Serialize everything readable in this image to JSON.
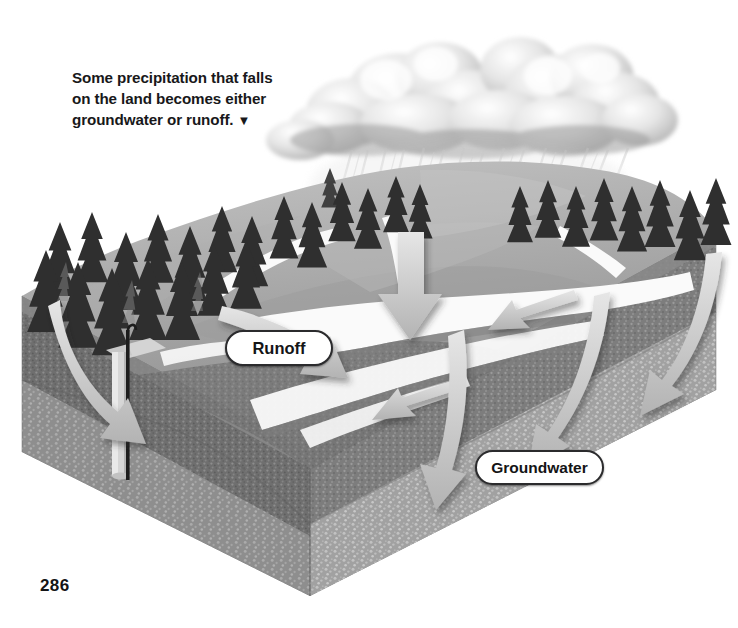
{
  "page": {
    "folio": "286",
    "background_color": "#ffffff"
  },
  "caption": {
    "line1": "Some precipitation that falls",
    "line2": "on the land becomes either",
    "line3": "groundwater or runoff.",
    "pointer_glyph": "▼",
    "color": "#18181a"
  },
  "labels": {
    "runoff": "Runoff",
    "groundwater": "Groundwater"
  },
  "diagram": {
    "style": "grayscale airbrush illustration, 3D cutaway block",
    "palette": {
      "sky": "#ffffff",
      "cloud_light": "#f2f2f2",
      "cloud_mid": "#c9c9c9",
      "cloud_shadow": "#8f8f8f",
      "rain": "#d8d8d8",
      "terrain_light": "#bdbdbd",
      "terrain_mid": "#9a9a9a",
      "terrain_dark": "#7b7b7b",
      "water_white": "#fbfbfb",
      "soil_dark": "#6f6f6f",
      "soil_speckle": "#8c8c8c",
      "aquifer": "#a3a3a3",
      "arrow_fill": "#cfcfcf",
      "arrow_edge": "#efefef",
      "tree_dark": "#2e2e2e",
      "tree_mid": "#6a6a6a",
      "well_casing": "#d6d6d6",
      "well_pipe": "#1d1d1d"
    },
    "elements": [
      {
        "name": "cumulus-cloud-bank",
        "note": "two billowing storm clouds across upper center-right"
      },
      {
        "name": "rain-streaks",
        "note": "diagonal precipitation falling from clouds onto hillside"
      },
      {
        "name": "conifer-forest",
        "note": "rows of spruce trees along the ridge crest, left to right"
      },
      {
        "name": "stream-channels",
        "note": "white braided river/stream channels in the valley"
      },
      {
        "name": "cutaway-block",
        "note": "3D wedge cutaway converging at bottom center"
      },
      {
        "name": "soil-layer",
        "note": "speckled dark upper subsurface layer"
      },
      {
        "name": "aquifer-layer",
        "note": "lighter speckled saturated zone below"
      },
      {
        "name": "water-well",
        "note": "vertical well casing with hooked pipe on left bench"
      }
    ],
    "arrows": [
      {
        "id": "a1",
        "kind": "infiltration",
        "note": "left curved arrow descending into soil near well"
      },
      {
        "id": "a2",
        "kind": "runoff",
        "note": "upper-left arrow sloping right down the hillside"
      },
      {
        "id": "a3",
        "kind": "precipitation",
        "note": "large straight arrow down from rain into valley"
      },
      {
        "id": "a4",
        "kind": "runoff",
        "note": "horizontal arrow pointing left along the channel"
      },
      {
        "id": "a5",
        "kind": "runoff",
        "note": "second horizontal arrow pointing left, lower"
      },
      {
        "id": "a6",
        "kind": "infiltration",
        "note": "center arrow curving down into groundwater"
      },
      {
        "id": "a7",
        "kind": "infiltration",
        "note": "right-center arrow curving down into aquifer"
      },
      {
        "id": "a8",
        "kind": "infiltration",
        "note": "far-right arrow curving down and left into aquifer"
      }
    ]
  }
}
